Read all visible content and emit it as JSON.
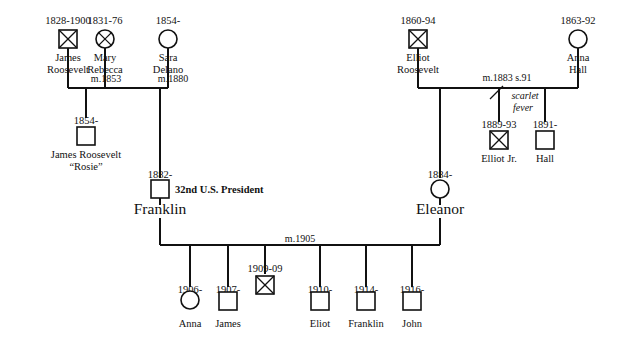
{
  "diagram": {
    "background_color": "#ffffff",
    "line_color": "#111111"
  },
  "people": {
    "james_roosevelt": {
      "dates": "1828-1900",
      "name_line1": "James",
      "name_line2": "Roosevelt",
      "symbol": "crossed-square"
    },
    "mary_rebecca": {
      "dates": "1831-76",
      "name_line1": "Mary",
      "name_line2": "Rebecca",
      "symbol": "crossed-circle"
    },
    "sara_delano": {
      "dates": "1854-",
      "name_line1": "Sara",
      "name_line2": "Delano",
      "symbol": "circle"
    },
    "rosie": {
      "dates": "1854-",
      "name_line1": "James Roosevelt",
      "name_line2": "“Rosie”",
      "symbol": "square"
    },
    "franklin": {
      "dates": "1882-",
      "name": "Franklin",
      "symbol": "square",
      "badge": "32nd U.S. President"
    },
    "elliot_roosevelt": {
      "dates": "1860-94",
      "name_line1": "Elliot",
      "name_line2": "Roosevelt",
      "symbol": "crossed-square"
    },
    "anna_hall": {
      "dates": "1863-92",
      "name_line1": "Anna",
      "name_line2": "Hall",
      "symbol": "circle"
    },
    "elliot_jr": {
      "dates": "1889-93",
      "name": "Elliot Jr.",
      "symbol": "crossed-square"
    },
    "hall": {
      "dates": "1891-",
      "name": "Hall",
      "symbol": "square"
    },
    "eleanor": {
      "dates": "1884-",
      "name": "Eleanor",
      "symbol": "circle"
    },
    "anna": {
      "dates": "1906-",
      "name": "Anna",
      "symbol": "circle"
    },
    "james": {
      "dates": "1907-",
      "name": "James",
      "symbol": "square"
    },
    "infant": {
      "dates": "1909-09",
      "name": "",
      "symbol": "crossed-square"
    },
    "eliot": {
      "dates": "1910-",
      "name": "Eliot",
      "symbol": "square"
    },
    "franklin_jr": {
      "dates": "1914-",
      "name": "Franklin",
      "symbol": "square"
    },
    "john": {
      "dates": "1916-",
      "name": "John",
      "symbol": "square"
    }
  },
  "marriages": {
    "james_mary": "m.1853",
    "james_sara": "m.1880",
    "elliot_anna": "m.1883 s.91",
    "franklin_eleanor": "m.1905"
  },
  "annotations": {
    "scarlet_fever_line1": "scarlet",
    "scarlet_fever_line2": "fever"
  }
}
